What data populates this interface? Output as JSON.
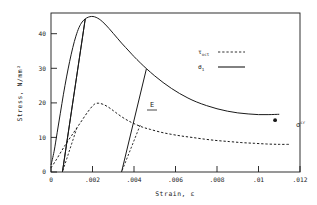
{
  "chart_data": {
    "type": "line",
    "title": "",
    "xlabel": "Strain, ε",
    "ylabel": "Stress, N/mm²",
    "xlim": [
      0,
      0.012
    ],
    "ylim": [
      0,
      46
    ],
    "grid": false,
    "xticks": [
      0,
      0.002,
      0.004,
      0.006,
      0.008,
      0.01,
      0.012
    ],
    "xticklabels": [
      "0",
      ".002",
      ".004",
      ".006",
      ".008",
      ".01",
      ".012"
    ],
    "yticks": [
      0,
      10,
      20,
      30,
      40
    ],
    "yticklabels": [
      "0",
      "10",
      "20",
      "30",
      "40"
    ],
    "legend": {
      "position": "upper-right-inside",
      "entries": [
        {
          "label": "τ",
          "sub": "oct",
          "style": "dashed"
        },
        {
          "label": "σ",
          "sub": "1",
          "style": "solid"
        }
      ]
    },
    "series": [
      {
        "name": "sigma_1_envelope",
        "style": "solid",
        "points": [
          [
            0.0,
            2.0
          ],
          [
            0.00015,
            6.0
          ],
          [
            0.0003,
            11.5
          ],
          [
            0.00045,
            17.0
          ],
          [
            0.0006,
            22.5
          ],
          [
            0.00075,
            27.5
          ],
          [
            0.0009,
            32.0
          ],
          [
            0.00105,
            36.0
          ],
          [
            0.0012,
            39.3
          ],
          [
            0.00135,
            41.8
          ],
          [
            0.0015,
            43.4
          ],
          [
            0.00165,
            44.3
          ],
          [
            0.0018,
            44.8
          ],
          [
            0.00195,
            45.0
          ],
          [
            0.0021,
            44.9
          ],
          [
            0.00225,
            44.5
          ],
          [
            0.0024,
            43.9
          ],
          [
            0.0026,
            42.8
          ],
          [
            0.0028,
            41.5
          ],
          [
            0.003,
            40.1
          ],
          [
            0.0032,
            38.7
          ],
          [
            0.0034,
            37.3
          ],
          [
            0.0036,
            36.0
          ],
          [
            0.0038,
            34.7
          ],
          [
            0.004,
            33.4
          ],
          [
            0.0043,
            31.6
          ],
          [
            0.0046,
            29.9
          ],
          [
            0.005,
            27.8
          ],
          [
            0.0054,
            25.9
          ],
          [
            0.0058,
            24.2
          ],
          [
            0.0062,
            22.7
          ],
          [
            0.0066,
            21.4
          ],
          [
            0.007,
            20.3
          ],
          [
            0.0075,
            19.2
          ],
          [
            0.008,
            18.3
          ],
          [
            0.0085,
            17.6
          ],
          [
            0.009,
            17.1
          ],
          [
            0.0095,
            16.8
          ],
          [
            0.01,
            16.6
          ],
          [
            0.0105,
            16.6
          ],
          [
            0.011,
            16.7
          ]
        ]
      },
      {
        "name": "tau_oct_envelope",
        "style": "dashed",
        "points": [
          [
            0.0,
            1.2
          ],
          [
            0.00025,
            3.5
          ],
          [
            0.0005,
            6.0
          ],
          [
            0.00075,
            8.4
          ],
          [
            0.001,
            10.6
          ],
          [
            0.00125,
            12.8
          ],
          [
            0.0015,
            15.0
          ],
          [
            0.00175,
            17.2
          ],
          [
            0.002,
            19.1
          ],
          [
            0.00215,
            19.8
          ],
          [
            0.0023,
            19.9
          ],
          [
            0.0025,
            19.6
          ],
          [
            0.0027,
            19.0
          ],
          [
            0.0029,
            18.2
          ],
          [
            0.0031,
            17.3
          ],
          [
            0.0034,
            16.0
          ],
          [
            0.0037,
            14.9
          ],
          [
            0.004,
            14.0
          ],
          [
            0.0044,
            13.0
          ],
          [
            0.0048,
            12.3
          ],
          [
            0.0053,
            11.5
          ],
          [
            0.0058,
            10.9
          ],
          [
            0.0063,
            10.4
          ],
          [
            0.0068,
            10.0
          ],
          [
            0.0074,
            9.5
          ],
          [
            0.008,
            9.1
          ],
          [
            0.0086,
            8.8
          ],
          [
            0.0092,
            8.5
          ],
          [
            0.0098,
            8.3
          ],
          [
            0.0104,
            8.1
          ],
          [
            0.011,
            8.0
          ],
          [
            0.0115,
            8.0
          ]
        ]
      },
      {
        "name": "unload-1-sigma",
        "style": "solid",
        "points": [
          [
            0.00165,
            44.3
          ],
          [
            0.00055,
            0.0
          ]
        ]
      },
      {
        "name": "unload-2-sigma",
        "style": "solid",
        "points": [
          [
            0.0046,
            29.9
          ],
          [
            0.0034,
            0.0
          ]
        ]
      },
      {
        "name": "unload-1-tau",
        "style": "dashed",
        "points": [
          [
            0.00125,
            12.8
          ],
          [
            0.00055,
            0.0
          ]
        ]
      },
      {
        "name": "unload-2-tau",
        "style": "dashed",
        "points": [
          [
            0.0043,
            13.6
          ],
          [
            0.0034,
            0.0
          ]
        ]
      },
      {
        "name": "reload-1-sigma",
        "style": "solid",
        "points": [
          [
            0.00055,
            0.0
          ],
          [
            0.00165,
            44.3
          ]
        ]
      }
    ],
    "markers": [
      {
        "name": "sigma-cr-point",
        "x": 0.0108,
        "y": 15.0,
        "shape": "dot"
      }
    ],
    "annotations": [
      {
        "name": "modulus-E",
        "text": "E",
        "underline": true,
        "x": 0.0045,
        "y": 24.5
      },
      {
        "name": "sigma-cr-label",
        "base": "σ",
        "sup": "cr",
        "x": 0.0115,
        "y": 15.3
      }
    ]
  }
}
